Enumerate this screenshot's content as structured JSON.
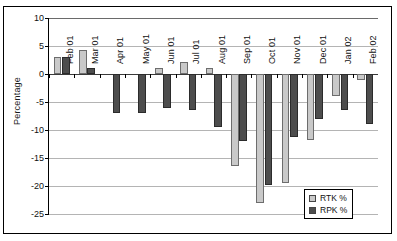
{
  "chart_data": {
    "type": "bar",
    "title": "",
    "xlabel": "",
    "ylabel": "Percentage",
    "ylim": [
      -25,
      10
    ],
    "yticks": [
      10,
      5,
      0,
      -5,
      -10,
      -15,
      -20,
      -25
    ],
    "ytick_labels": [
      "10",
      "5",
      "0",
      "-5",
      "-10",
      "-15",
      "-20",
      "-25"
    ],
    "grid": true,
    "legend_position": "bottom-right",
    "categories": [
      "Feb 01",
      "Mar 01",
      "Apr 01",
      "May 01",
      "Jun 01",
      "Jul 01",
      "Aug 01",
      "Sep 01",
      "Oct 01",
      "Nov 01",
      "Dec 01",
      "Jan 02",
      "Feb 02"
    ],
    "series": [
      {
        "name": "RTK %",
        "color": "#c9c9c9",
        "values": [
          3.0,
          4.2,
          0.0,
          0.0,
          1.0,
          2.1,
          1.1,
          -16.5,
          -23.0,
          -19.5,
          -11.8,
          -4.0,
          -1.0
        ]
      },
      {
        "name": "RPK %",
        "color": "#4d4d4d",
        "values": [
          3.1,
          1.1,
          -7.0,
          -7.0,
          -6.0,
          -6.5,
          -9.5,
          -12.0,
          -19.8,
          -11.3,
          -8.0,
          -6.5,
          -9.0
        ]
      }
    ]
  },
  "legend": {
    "items": [
      {
        "label": "RTK %",
        "swatch": "rtk"
      },
      {
        "label": "RPK %",
        "swatch": "rpk"
      }
    ]
  }
}
